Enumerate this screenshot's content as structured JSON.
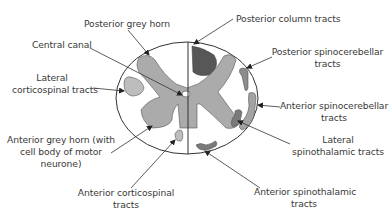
{
  "diagram": {
    "colors": {
      "outline": "#333333",
      "grey_matter": "#ababab",
      "posterior_column": "#575757",
      "tracts_light": "#bdbdbd",
      "tracts_medium": "#8c8c8c",
      "background": "#ffffff",
      "text": "#3a3a3a"
    },
    "labels": {
      "posterior_grey_horn": "Posterior grey horn",
      "central_canal": "Central canal",
      "lateral_corticospinal_1": "Lateral",
      "lateral_corticospinal_2": "corticospinal tracts",
      "anterior_grey_horn_1": "Anterior grey horn (with",
      "anterior_grey_horn_2": "cell body of motor",
      "anterior_grey_horn_3": "neurone)",
      "anterior_corticospinal_1": "Anterior corticospinal",
      "anterior_corticospinal_2": "tracts",
      "posterior_column": "Posterior column tracts",
      "posterior_spinocerebellar_1": "Posterior spinocerebellar",
      "posterior_spinocerebellar_2": "tracts",
      "anterior_spinocerebellar_1": "Anterior spinocerebellar",
      "anterior_spinocerebellar_2": "tracts",
      "lateral_spinothalamic_1": "Lateral",
      "lateral_spinothalamic_2": "spinothalamic tracts",
      "anterior_spinothalamic_1": "Anterior spinothalamic",
      "anterior_spinothalamic_2": "tracts"
    }
  }
}
